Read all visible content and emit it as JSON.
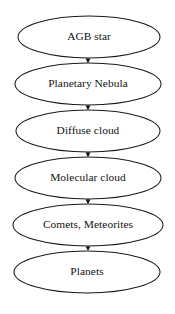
{
  "diagram": {
    "orientation": "top-to-bottom",
    "background_color": "#ffffff",
    "stroke_color": "#1a1a1a",
    "text_color": "#131313",
    "node_shape": "ellipse",
    "nodes": [
      {
        "id": "agb-star",
        "label": "AGB star",
        "cx": 89,
        "cy": 37,
        "rx": 71,
        "ry": 21
      },
      {
        "id": "planetary-nebula",
        "label": "Planetary Nebula",
        "cx": 88,
        "cy": 84,
        "rx": 73,
        "ry": 21
      },
      {
        "id": "diffuse-cloud",
        "label": "Diffuse cloud",
        "cx": 88,
        "cy": 131,
        "rx": 72,
        "ry": 21
      },
      {
        "id": "molecular-cloud",
        "label": "Molecular cloud",
        "cx": 88,
        "cy": 178,
        "rx": 73,
        "ry": 21
      },
      {
        "id": "comets-meteorites",
        "label": "Comets, Meteorites",
        "cx": 88,
        "cy": 225,
        "rx": 75,
        "ry": 21
      },
      {
        "id": "planets",
        "label": "Planets",
        "cx": 87,
        "cy": 272,
        "rx": 73,
        "ry": 21
      }
    ],
    "edges": [
      {
        "id": "edge-agb-to-nebula",
        "from": "agb-star",
        "to": "planetary-nebula",
        "x": 88,
        "y1": 58,
        "y2": 63,
        "arrowhead": "filled-triangle"
      },
      {
        "id": "edge-nebula-to-diffuse",
        "from": "planetary-nebula",
        "to": "diffuse-cloud",
        "x": 88,
        "y1": 105,
        "y2": 110,
        "arrowhead": "filled-triangle"
      },
      {
        "id": "edge-diffuse-to-molecular",
        "from": "diffuse-cloud",
        "to": "molecular-cloud",
        "x": 88,
        "y1": 152,
        "y2": 157,
        "arrowhead": "filled-triangle"
      },
      {
        "id": "edge-molecular-to-comets",
        "from": "molecular-cloud",
        "to": "comets-meteorites",
        "x": 88,
        "y1": 199,
        "y2": 204,
        "arrowhead": "filled-triangle"
      },
      {
        "id": "edge-comets-to-planets",
        "from": "comets-meteorites",
        "to": "planets",
        "x": 88,
        "y1": 246,
        "y2": 251,
        "arrowhead": "filled-triangle"
      }
    ]
  }
}
